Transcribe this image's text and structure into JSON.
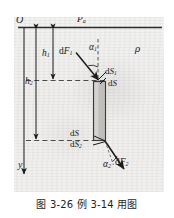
{
  "figure": {
    "caption": "图 3-26   例 3-14 用图",
    "origin_label": "O",
    "axis_label_y": "y",
    "surface_pressure_label": "P",
    "surface_pressure_sub": "a",
    "density_label": "ρ",
    "depth_1_label": "h",
    "depth_1_sub": "1",
    "depth_2_label": "h",
    "depth_2_sub": "2",
    "force_1_label": "dF",
    "force_1_sub": "1",
    "force_2_label": "dF",
    "force_2_sub": "2",
    "angle_1_label": "α",
    "angle_1_sub": "1",
    "angle_2_label": "α",
    "angle_2_sub": "2",
    "area_top_label": "dS",
    "area_top_sub": "1",
    "area_mid_label": "dS",
    "area_bottom_plain_label": "dS",
    "area_bottom_label": "dS",
    "area_bottom_sub": "2",
    "colors": {
      "ink": "#1a1a1a",
      "plate_fill": "#bfbebb",
      "plate_stroke": "#3a3a3a",
      "paper": "#f1f0ee"
    }
  }
}
